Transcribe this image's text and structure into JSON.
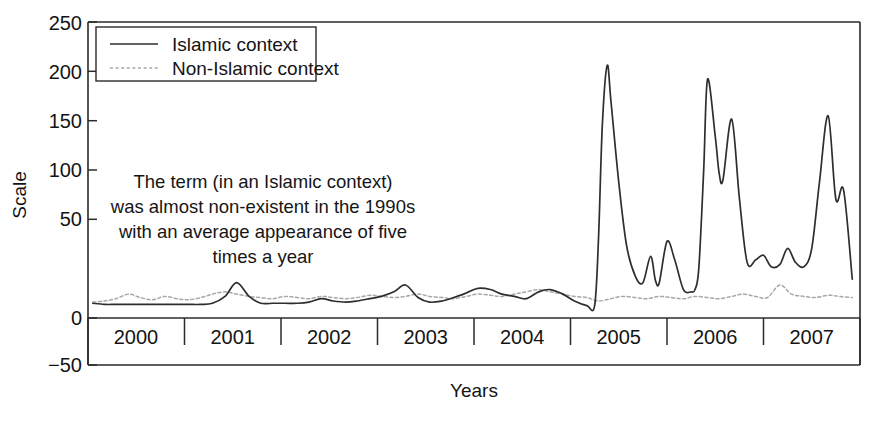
{
  "chart_data": {
    "type": "line",
    "title": "",
    "xlabel": "Years",
    "ylabel": "Scale",
    "xlim": [
      1999.75,
      2007.75
    ],
    "ylim": [
      -50,
      250
    ],
    "ytick_values": [
      250,
      200,
      150,
      100,
      50,
      0,
      -50
    ],
    "ytick_labels": [
      "250",
      "200",
      "150",
      "100",
      "50",
      "0",
      "−50"
    ],
    "xtick_values": [
      2000,
      2001,
      2002,
      2003,
      2004,
      2005,
      2006,
      2007,
      2008
    ],
    "xtick_labels": [
      "2000",
      "2001",
      "2002",
      "2003",
      "2004",
      "2005",
      "2006",
      "2007"
    ],
    "grid": false,
    "legend_position": "upper left",
    "legend_entries": [
      "Islamic context",
      "Non-Islamic context"
    ],
    "annotation": {
      "lines": [
        "The term (in an Islamic context)",
        "was almost non-existent in the 1990s",
        "with an average appearance of five",
        "times a year"
      ]
    },
    "colors": {
      "islamic": "#2e2e2e",
      "non_islamic": "#a8a8a8",
      "axis": "#2b2b2b",
      "background": "#ffffff"
    },
    "series": [
      {
        "name": "Islamic context",
        "style": "solid",
        "color": "#2e2e2e",
        "x": [
          1999.8,
          1999.92,
          2000.04,
          2000.17,
          2000.29,
          2000.42,
          2000.54,
          2000.67,
          2000.79,
          2000.92,
          2001.04,
          2001.17,
          2001.29,
          2001.42,
          2001.54,
          2001.67,
          2001.79,
          2001.92,
          2002.04,
          2002.17,
          2002.29,
          2002.42,
          2002.54,
          2002.67,
          2002.79,
          2002.92,
          2003.04,
          2003.17,
          2003.29,
          2003.42,
          2003.54,
          2003.67,
          2003.79,
          2003.92,
          2004.04,
          2004.17,
          2004.29,
          2004.42,
          2004.54,
          2004.67,
          2004.79,
          2004.92,
          2005.0,
          2005.04,
          2005.08,
          2005.13,
          2005.17,
          2005.25,
          2005.33,
          2005.42,
          2005.5,
          2005.58,
          2005.63,
          2005.67,
          2005.75,
          2005.83,
          2005.92,
          2006.0,
          2006.04,
          2006.08,
          2006.13,
          2006.17,
          2006.25,
          2006.29,
          2006.33,
          2006.42,
          2006.5,
          2006.58,
          2006.67,
          2006.75,
          2006.83,
          2006.92,
          2007.0,
          2007.08,
          2007.17,
          2007.25,
          2007.33,
          2007.42,
          2007.5,
          2007.58,
          2007.67
        ],
        "y": [
          4,
          3,
          3,
          3,
          3,
          3,
          3,
          3,
          3,
          3,
          4,
          10,
          22,
          10,
          4,
          4,
          4,
          4,
          5,
          8,
          6,
          5,
          6,
          8,
          10,
          14,
          20,
          9,
          5,
          6,
          9,
          13,
          17,
          16,
          12,
          10,
          8,
          14,
          16,
          12,
          6,
          2,
          2,
          60,
          160,
          212,
          180,
          110,
          55,
          28,
          22,
          45,
          24,
          22,
          58,
          42,
          16,
          14,
          16,
          35,
          120,
          200,
          150,
          118,
          112,
          165,
          96,
          40,
          42,
          46,
          36,
          38,
          52,
          40,
          36,
          52,
          110,
          168,
          95,
          103,
          25
        ]
      },
      {
        "name": "Non-Islamic context",
        "style": "dotted",
        "color": "#a8a8a8",
        "x": [
          1999.8,
          1999.92,
          2000.04,
          2000.17,
          2000.29,
          2000.42,
          2000.54,
          2000.67,
          2000.79,
          2000.92,
          2001.04,
          2001.17,
          2001.29,
          2001.42,
          2001.54,
          2001.67,
          2001.79,
          2001.92,
          2002.04,
          2002.17,
          2002.29,
          2002.42,
          2002.54,
          2002.67,
          2002.79,
          2002.92,
          2003.04,
          2003.17,
          2003.29,
          2003.42,
          2003.54,
          2003.67,
          2003.79,
          2003.92,
          2004.04,
          2004.17,
          2004.29,
          2004.42,
          2004.54,
          2004.67,
          2004.79,
          2004.92,
          2005.04,
          2005.17,
          2005.29,
          2005.42,
          2005.54,
          2005.67,
          2005.79,
          2005.92,
          2006.04,
          2006.17,
          2006.29,
          2006.42,
          2006.54,
          2006.67,
          2006.79,
          2006.92,
          2007.04,
          2007.17,
          2007.29,
          2007.42,
          2007.54,
          2007.67
        ],
        "y": [
          5,
          6,
          8,
          12,
          9,
          7,
          10,
          8,
          7,
          9,
          12,
          14,
          12,
          10,
          9,
          8,
          10,
          9,
          8,
          10,
          9,
          8,
          9,
          11,
          10,
          9,
          10,
          12,
          10,
          9,
          8,
          10,
          12,
          11,
          10,
          12,
          14,
          16,
          14,
          12,
          10,
          9,
          6,
          8,
          10,
          9,
          8,
          10,
          9,
          8,
          10,
          9,
          8,
          10,
          12,
          10,
          9,
          20,
          12,
          10,
          9,
          11,
          10,
          9
        ]
      }
    ],
    "peaks": [
      {
        "label": "first spike",
        "approx_x": 2005.13,
        "approx_y": 212
      },
      {
        "label": "second spike",
        "approx_x": 2006.17,
        "approx_y": 200
      },
      {
        "label": "third spike",
        "approx_x": 2006.42,
        "approx_y": 165
      },
      {
        "label": "fourth spike",
        "approx_x": 2007.42,
        "approx_y": 168
      },
      {
        "label": "fifth spike",
        "approx_x": 2007.58,
        "approx_y": 103
      }
    ]
  }
}
